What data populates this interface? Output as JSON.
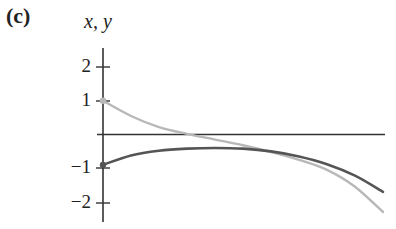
{
  "panel": {
    "label": "(c)"
  },
  "chart_data": {
    "type": "line",
    "title": "",
    "xlabel": "",
    "ylabel": "x, y",
    "ylim": [
      -2.6,
      2.6
    ],
    "yticks": [
      2,
      1,
      -1,
      -2
    ],
    "ytick_labels": [
      "2",
      "1",
      "−1",
      "−2"
    ],
    "grid": false,
    "legend": null,
    "x": [
      0,
      0.1,
      0.2,
      0.3,
      0.4,
      0.5,
      0.6,
      0.7,
      0.8,
      0.9,
      1.0
    ],
    "series": [
      {
        "name": "x (light curve)",
        "color": "#b8b8b8",
        "values": [
          1.0,
          0.55,
          0.22,
          0.02,
          -0.15,
          -0.32,
          -0.52,
          -0.75,
          -1.05,
          -1.55,
          -2.3
        ]
      },
      {
        "name": "y (dark curve)",
        "color": "#555555",
        "values": [
          -0.9,
          -0.62,
          -0.48,
          -0.42,
          -0.4,
          -0.42,
          -0.5,
          -0.65,
          -0.88,
          -1.22,
          -1.7
        ]
      }
    ],
    "initial_points": [
      {
        "series": "x",
        "value": 1
      },
      {
        "series": "y",
        "value": -1
      }
    ]
  }
}
